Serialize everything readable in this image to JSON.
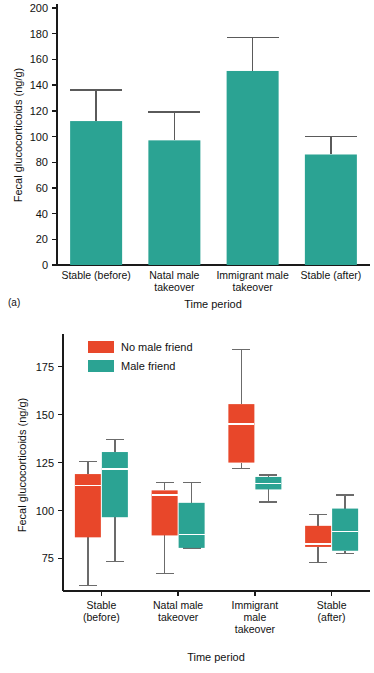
{
  "figure": {
    "panel_a_caption": "(a)",
    "panel_b_caption": "(b)"
  },
  "colors": {
    "teal": "#2BA393",
    "red": "#E8472A",
    "axis": "#1a1a1a",
    "error_bar": "#5a5a5a",
    "whisker": "#6b6b6b",
    "median": "#ffffff",
    "background": "#ffffff"
  },
  "chart_data": [
    {
      "type": "bar",
      "panel": "(a)",
      "title": "",
      "xlabel": "Time period",
      "ylabel": "Fecal glucocorticoids (ng/g)",
      "ylim": [
        0,
        200
      ],
      "yticks": [
        0,
        20,
        40,
        60,
        80,
        100,
        120,
        140,
        160,
        180,
        200
      ],
      "ytick_labels": [
        "0",
        "20",
        "40",
        "60",
        "80",
        "100",
        "120",
        "140",
        "160",
        "180",
        "200"
      ],
      "grid": false,
      "legend": "none",
      "categories": [
        "Stable (before)",
        "Natal male takeover",
        "Immigrant male takeover",
        "Stable (after)"
      ],
      "category_lines": [
        [
          "Stable (before)"
        ],
        [
          "Natal male",
          "takeover"
        ],
        [
          "Immigrant male",
          "takeover"
        ],
        [
          "Stable (after)"
        ]
      ],
      "series": [
        {
          "name": "Fecal glucocorticoids",
          "color": "#2BA393",
          "values": [
            112,
            97,
            151,
            86
          ],
          "error_upper": [
            136,
            119,
            177,
            100
          ]
        }
      ]
    },
    {
      "type": "box",
      "panel": "(b)",
      "title": "",
      "xlabel": "Time period",
      "ylabel": "Fecal glucocorticoids (ng/g)",
      "ylim": [
        58,
        190
      ],
      "yticks": [
        75,
        100,
        125,
        150,
        175
      ],
      "ytick_labels": [
        "75",
        "100",
        "125",
        "150",
        "175"
      ],
      "grid": false,
      "legend_position": "top-left",
      "categories": [
        "Stable (before)",
        "Natal male takeover",
        "Immigrant male takeover",
        "Stable (after)"
      ],
      "category_lines": [
        [
          "Stable",
          "(before)"
        ],
        [
          "Natal male",
          "takeover"
        ],
        [
          "Immigrant",
          "male",
          "takeover"
        ],
        [
          "Stable",
          "(after)"
        ]
      ],
      "series": [
        {
          "name": "No male friend",
          "color": "#E8472A",
          "boxes": [
            {
              "whisker_low": 61,
              "q1": 86,
              "median": 113,
              "q3": 119,
              "whisker_high": 125.5
            },
            {
              "whisker_low": 67,
              "q1": 87,
              "median": 108,
              "q3": 110.5,
              "whisker_high": 114.5
            },
            {
              "whisker_low": 122,
              "q1": 125,
              "median": 145,
              "q3": 155.5,
              "whisker_high": 184
            },
            {
              "whisker_low": 73,
              "q1": 81,
              "median": 82.5,
              "q3": 92,
              "whisker_high": 98
            }
          ]
        },
        {
          "name": "Male friend",
          "color": "#2BA393",
          "boxes": [
            {
              "whisker_low": 73.5,
              "q1": 96.5,
              "median": 121.5,
              "q3": 130.5,
              "whisker_high": 137
            },
            {
              "whisker_low": 80.5,
              "q1": 80.5,
              "median": 87.5,
              "q3": 104,
              "whisker_high": 114.5
            },
            {
              "whisker_low": 104.5,
              "q1": 111,
              "median": 114,
              "q3": 117.5,
              "whisker_high": 118.5
            },
            {
              "whisker_low": 77.5,
              "q1": 79,
              "median": 89,
              "q3": 101,
              "whisker_high": 108
            }
          ]
        }
      ]
    }
  ]
}
